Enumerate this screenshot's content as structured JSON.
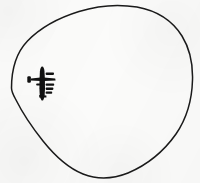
{
  "figure": {
    "kind": "scanned-line-drawing",
    "caption": "",
    "background_color": "#fbfbfa",
    "ink_color": "#1a1a1a",
    "width_px": 200,
    "height_px": 183
  },
  "chart_data": {
    "type": "line",
    "title": "",
    "subtitle": "",
    "xlabel": "",
    "ylabel": "",
    "grid": false,
    "legend": null,
    "annotations": [],
    "axis_ranges": {
      "x": [
        0,
        200
      ],
      "y": [
        0,
        183
      ]
    },
    "series": [
      {
        "name": "coverage-outline",
        "kind": "closed-curve",
        "stroke": "#1a1a1a",
        "stroke_width": 1.5,
        "fill": "none",
        "closed": true,
        "extremes": {
          "leftmost": [
            11,
            88
          ],
          "rightmost": [
            192,
            82
          ],
          "topmost": [
            130,
            6
          ],
          "bottommost": [
            120,
            178
          ]
        },
        "points": [
          [
            11,
            88
          ],
          [
            12,
            74
          ],
          [
            17,
            58
          ],
          [
            26,
            44
          ],
          [
            38,
            33
          ],
          [
            53,
            24
          ],
          [
            70,
            16
          ],
          [
            89,
            10
          ],
          [
            108,
            6
          ],
          [
            126,
            5
          ],
          [
            143,
            7
          ],
          [
            158,
            13
          ],
          [
            171,
            23
          ],
          [
            182,
            37
          ],
          [
            189,
            54
          ],
          [
            192,
            73
          ],
          [
            191,
            92
          ],
          [
            186,
            111
          ],
          [
            177,
            129
          ],
          [
            165,
            146
          ],
          [
            150,
            160
          ],
          [
            133,
            171
          ],
          [
            116,
            177
          ],
          [
            100,
            178
          ],
          [
            84,
            174
          ],
          [
            68,
            165
          ],
          [
            53,
            152
          ],
          [
            38,
            135
          ],
          [
            26,
            118
          ],
          [
            17,
            103
          ],
          [
            11,
            88
          ]
        ]
      }
    ],
    "markers": [
      {
        "name": "aircraft-silhouette",
        "label": "four-engine-bomber-planform",
        "kind": "filled-silhouette",
        "fill": "#111111",
        "heading": "up",
        "center": [
          42,
          83
        ],
        "wingspan_px": 26,
        "length_px": 32,
        "engine_count": 4
      }
    ]
  }
}
